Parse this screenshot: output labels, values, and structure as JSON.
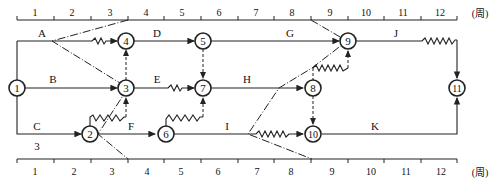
{
  "diagram": {
    "type": "time-scaled network diagram",
    "unit_label": "(周)",
    "scale_ticks": [
      "1",
      "2",
      "3",
      "4",
      "5",
      "6",
      "7",
      "8",
      "9",
      "10",
      "11",
      "12"
    ],
    "nodes": [
      {
        "id": "1",
        "label": "1"
      },
      {
        "id": "2",
        "label": "2"
      },
      {
        "id": "3",
        "label": "3"
      },
      {
        "id": "4",
        "label": "4"
      },
      {
        "id": "5",
        "label": "5"
      },
      {
        "id": "6",
        "label": "6"
      },
      {
        "id": "7",
        "label": "7"
      },
      {
        "id": "8",
        "label": "8"
      },
      {
        "id": "9",
        "label": "9"
      },
      {
        "id": "10",
        "label": "10"
      },
      {
        "id": "11",
        "label": "11"
      }
    ],
    "activities": [
      {
        "name": "A",
        "from": "1",
        "to": "4"
      },
      {
        "name": "B",
        "from": "1",
        "to": "3"
      },
      {
        "name": "C",
        "from": "1",
        "to": "2",
        "duration_note": "3"
      },
      {
        "name": "D",
        "from": "4",
        "to": "5"
      },
      {
        "name": "E",
        "from": "3",
        "to": "7"
      },
      {
        "name": "F",
        "from": "2",
        "to": "6"
      },
      {
        "name": "G",
        "from": "5",
        "to": "9"
      },
      {
        "name": "H",
        "from": "7",
        "to": "8"
      },
      {
        "name": "I",
        "from": "6",
        "to": "10"
      },
      {
        "name": "J",
        "from": "9",
        "to": "11"
      },
      {
        "name": "K",
        "from": "10",
        "to": "11"
      }
    ],
    "labels": {
      "A": "A",
      "B": "B",
      "C": "C",
      "C_note": "3",
      "D": "D",
      "E": "E",
      "F": "F",
      "G": "G",
      "H": "H",
      "I": "I",
      "J": "J",
      "K": "K"
    }
  }
}
